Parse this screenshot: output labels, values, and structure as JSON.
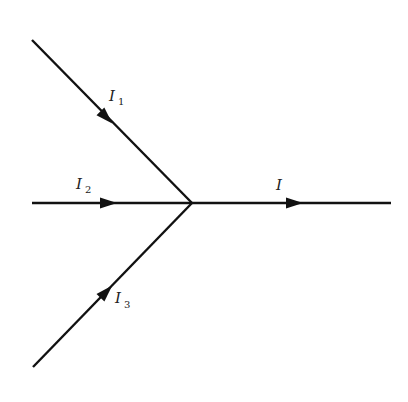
{
  "diagram": {
    "junction": "single node where three incoming currents combine into one outgoing current",
    "branches": [
      {
        "id": "branch-1",
        "label": "I",
        "subscript": "1",
        "direction": "into-junction",
        "from": "upper-left"
      },
      {
        "id": "branch-2",
        "label": "I",
        "subscript": "2",
        "direction": "into-junction",
        "from": "left"
      },
      {
        "id": "branch-3",
        "label": "I",
        "subscript": "3",
        "direction": "into-junction",
        "from": "lower-left"
      },
      {
        "id": "branch-out",
        "label": "I",
        "subscript": "",
        "direction": "out-of-junction",
        "to": "right"
      }
    ],
    "line_color": "#111111",
    "background": "#ffffff"
  }
}
